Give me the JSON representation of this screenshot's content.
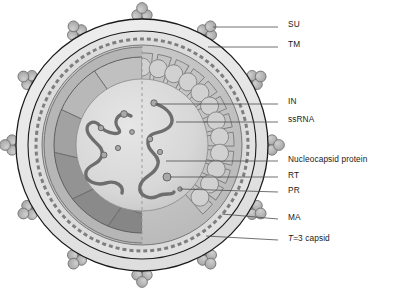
{
  "figure": {
    "background": "#ffffff",
    "width": 393,
    "height": 290
  },
  "palette": {
    "outline": "#1a1a1a",
    "envelope_outer": "#e9e9e9",
    "envelope_inner": "#d8d8d8",
    "lipid_dash": "#8d8d8d",
    "ma_layer": "#cfcfcf",
    "capsid_facet_light": "#c3c3c3",
    "capsid_facet_mid": "#a8a8a8",
    "capsid_facet_dark": "#8e8e8e",
    "core_fill": "#dcdcdc",
    "rna_strand": "#6e6e6e",
    "spike_knob": "#b4b4b4",
    "spike_stalk": "#8a8a8a",
    "leader_line": "#4d4d4d",
    "label_text": "#1a1a1a"
  },
  "particle": {
    "center_x": 142,
    "center_y": 145,
    "envelope_outer_radius": 126,
    "envelope_inner_radius": 114,
    "lipid_dash_radius": 106,
    "ma_outer_radius": 100,
    "capsid_radius": 88,
    "core_radius": 66,
    "divider": "vertical-dashed-midline",
    "left_half": "faceted T=3 capsid lattice",
    "right_half": "scalloped radial matrix segments"
  },
  "spikes": {
    "count": 12,
    "angles_deg": [
      270,
      300,
      330,
      0,
      30,
      60,
      90,
      120,
      150,
      180,
      210,
      240
    ],
    "knob_label": "SU",
    "stalk_label": "TM"
  },
  "rna": {
    "strand_count": 2,
    "left_strand": "ssRNA genome copy 1",
    "right_strand": "ssRNA genome copy 2",
    "bead_count": 10
  },
  "labels": [
    {
      "id": "su",
      "text": "SU",
      "italic_prefix": "",
      "x": 288,
      "y": 24,
      "line_x1": 278,
      "line_y1": 27,
      "line_x2": 213,
      "line_y2": 27
    },
    {
      "id": "tm",
      "text": "TM",
      "italic_prefix": "",
      "x": 288,
      "y": 44,
      "line_x1": 278,
      "line_y1": 47,
      "line_x2": 208,
      "line_y2": 47
    },
    {
      "id": "in",
      "text": "IN",
      "italic_prefix": "",
      "x": 288,
      "y": 101,
      "line_x1": 278,
      "line_y1": 104,
      "line_x2": 155,
      "line_y2": 104
    },
    {
      "id": "ssrna",
      "text": "ssRNA",
      "italic_prefix": "",
      "x": 288,
      "y": 119,
      "line_x1": 278,
      "line_y1": 122,
      "line_x2": 176,
      "line_y2": 122
    },
    {
      "id": "nc",
      "text": "Nucleocapsid protein",
      "italic_prefix": "",
      "x": 288,
      "y": 158,
      "line_x1": 278,
      "line_y1": 161,
      "line_x2": 166,
      "line_y2": 161
    },
    {
      "id": "rt",
      "text": "RT",
      "italic_prefix": "",
      "x": 288,
      "y": 174,
      "line_x1": 278,
      "line_y1": 177,
      "line_x2": 170,
      "line_y2": 177
    },
    {
      "id": "pr",
      "text": "PR",
      "italic_prefix": "",
      "x": 288,
      "y": 189,
      "line_x1": 278,
      "line_y1": 192,
      "line_x2": 180,
      "line_y2": 189
    },
    {
      "id": "ma",
      "text": "MA",
      "italic_prefix": "",
      "x": 288,
      "y": 216,
      "line_x1": 278,
      "line_y1": 219,
      "line_x2": 222,
      "line_y2": 214
    },
    {
      "id": "t3",
      "text": "=3 capsid",
      "italic_prefix": "T",
      "x": 288,
      "y": 237,
      "line_x1": 278,
      "line_y1": 240,
      "line_x2": 206,
      "line_y2": 236
    }
  ]
}
